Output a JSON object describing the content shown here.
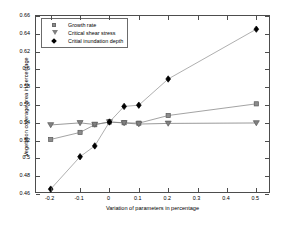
{
  "chart_data": {
    "type": "line",
    "title": "",
    "xlabel": "Variation of parameters in percentage",
    "ylabel": "Vegetation coverage area in percentage",
    "xlim": [
      -0.25,
      0.55
    ],
    "ylim": [
      0.46,
      0.66
    ],
    "xticks": [
      -0.2,
      -0.1,
      0,
      0.1,
      0.2,
      0.3,
      0.4,
      0.5
    ],
    "xtick_labels": [
      "-0.2",
      "-0.1",
      "0",
      "0.1",
      "0.2",
      "0.3",
      "0.4",
      "0.5"
    ],
    "yticks": [
      0.46,
      0.48,
      0.5,
      0.52,
      0.54,
      0.56,
      0.58,
      0.6,
      0.62,
      0.64,
      0.66
    ],
    "ytick_labels": [
      "0.46",
      "0.48",
      "0.5",
      "0.52",
      "0.54",
      "0.56",
      "0.58",
      "0.6",
      "0.62",
      "0.64",
      "0.66"
    ],
    "grid": false,
    "legend_position": "top-left",
    "x": [
      -0.2,
      -0.1,
      -0.05,
      0,
      0.05,
      0.1,
      0.2,
      0.5
    ],
    "series": [
      {
        "name": "Growth rate",
        "marker": "square",
        "color": "#8c8c8c",
        "line_color": "#8c8c8c",
        "values": [
          0.5213,
          0.5292,
          0.5379,
          0.5409,
          0.5401,
          0.5396,
          0.5482,
          0.5613
        ]
      },
      {
        "name": "Critical shear stress",
        "marker": "triangle-down",
        "color": "#808080",
        "line_color": "#808080",
        "values": [
          0.5376,
          0.5399,
          0.5381,
          0.5409,
          0.5398,
          0.5386,
          0.5393,
          0.5398
        ]
      },
      {
        "name": "Critial inundation depth",
        "marker": "diamond",
        "color": "#000000",
        "line_color": "#9a9a9a",
        "values": [
          0.4655,
          0.5019,
          0.514,
          0.5409,
          0.5584,
          0.5598,
          0.5892,
          0.6452
        ]
      }
    ]
  },
  "axes": {
    "frame_color": "#4d4d4d"
  }
}
